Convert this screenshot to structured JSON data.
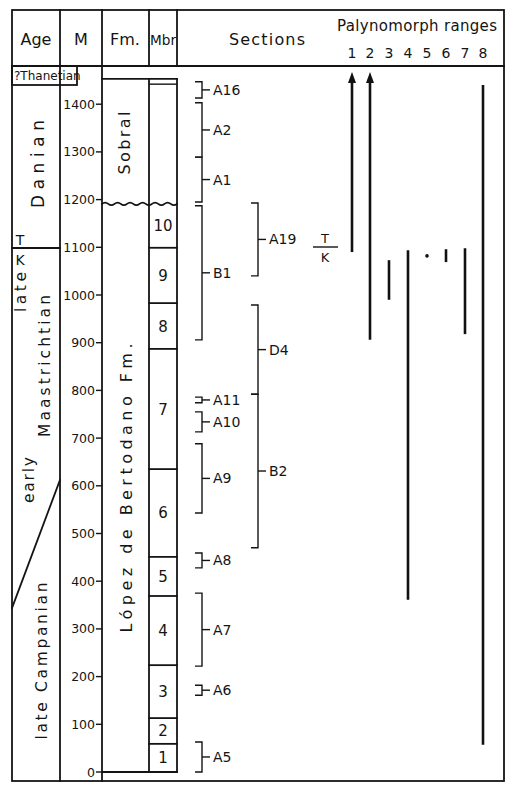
{
  "header": {
    "age": "Age",
    "m": "M",
    "fm": "Fm.",
    "mbr": "Mbr",
    "sections": "Sections",
    "palynomorph": "Palynomorph ranges",
    "range_numbers": [
      "1",
      "2",
      "3",
      "4",
      "5",
      "6",
      "7",
      "8"
    ]
  },
  "age_column": {
    "thanetian": "?Thanetian",
    "danian": "Danian",
    "t": "T",
    "k": "K",
    "late": "late",
    "maastrichtian": "Maastrichtian",
    "early": "early",
    "late_campanian": "late Campanian",
    "tk_boundary_m": 1098,
    "early_late_boundary_m": [
      612,
      344
    ]
  },
  "formations": {
    "sobral": "Sobral",
    "lopez": "López de Bertodano Fm.",
    "unconformity_m": 1191,
    "top_m": 1453,
    "sobral_inner_line_m": 1442
  },
  "meter_axis": {
    "label": "M",
    "ticks": [
      "0",
      "100",
      "200",
      "300",
      "400",
      "500",
      "600",
      "700",
      "800",
      "900",
      "1000",
      "1100",
      "1200",
      "1300",
      "1400"
    ]
  },
  "members": [
    {
      "label": "1",
      "base": 0,
      "top": 59
    },
    {
      "label": "2",
      "base": 59,
      "top": 113
    },
    {
      "label": "3",
      "base": 113,
      "top": 224
    },
    {
      "label": "4",
      "base": 224,
      "top": 369
    },
    {
      "label": "5",
      "base": 369,
      "top": 451
    },
    {
      "label": "6",
      "base": 451,
      "top": 635
    },
    {
      "label": "7",
      "base": 635,
      "top": 887
    },
    {
      "label": "8",
      "base": 887,
      "top": 983
    },
    {
      "label": "9",
      "base": 983,
      "top": 1099
    },
    {
      "label": "10",
      "base": 1099,
      "top": 1191
    }
  ],
  "sections": [
    {
      "label": "A16",
      "base": 1413,
      "top": 1447,
      "col": 1
    },
    {
      "label": "A2",
      "base": 1289,
      "top": 1403,
      "col": 1
    },
    {
      "label": "A1",
      "base": 1195,
      "top": 1289,
      "col": 1
    },
    {
      "label": "B1",
      "base": 906,
      "top": 1187,
      "col": 1
    },
    {
      "label": "A11",
      "base": 774,
      "top": 786,
      "col": 1
    },
    {
      "label": "A10",
      "base": 713,
      "top": 755,
      "col": 1
    },
    {
      "label": "A9",
      "base": 543,
      "top": 688,
      "col": 1
    },
    {
      "label": "A8",
      "base": 428,
      "top": 459,
      "col": 1
    },
    {
      "label": "A7",
      "base": 222,
      "top": 375,
      "col": 1
    },
    {
      "label": "A6",
      "base": 161,
      "top": 182,
      "col": 1
    },
    {
      "label": "A5",
      "base": 0,
      "top": 63,
      "col": 1
    },
    {
      "label": "A19",
      "base": 1040,
      "top": 1193,
      "col": 2
    },
    {
      "label": "D4",
      "base": 792,
      "top": 979,
      "col": 2
    },
    {
      "label": "B2",
      "base": 470,
      "top": 792,
      "col": 2
    }
  ],
  "tk_marker": {
    "t": "T",
    "k": "K",
    "level_m": 1098
  },
  "chart_data": {
    "type": "bar",
    "title": "Palynomorph ranges",
    "xlabel": "Palynomorph taxon",
    "ylabel": "M",
    "ylim": [
      0,
      1450
    ],
    "yticks": [
      0,
      100,
      200,
      300,
      400,
      500,
      600,
      700,
      800,
      900,
      1000,
      1100,
      1200,
      1300,
      1400
    ],
    "grid": false,
    "categories": [
      "1",
      "2",
      "3",
      "4",
      "5",
      "6",
      "7",
      "8"
    ],
    "ranges": [
      {
        "taxon": "1",
        "base_m": 1090,
        "top_m": 1467,
        "extends_above": true
      },
      {
        "taxon": "2",
        "base_m": 906,
        "top_m": 1467,
        "extends_above": true
      },
      {
        "taxon": "3",
        "base_m": 990,
        "top_m": 1073,
        "extends_above": false
      },
      {
        "taxon": "4",
        "base_m": 361,
        "top_m": 1094,
        "extends_above": false
      },
      {
        "taxon": "5",
        "base_m": 1082,
        "top_m": 1082,
        "extends_above": false,
        "single_occurrence": true
      },
      {
        "taxon": "6",
        "base_m": 1069,
        "top_m": 1096,
        "extends_above": false
      },
      {
        "taxon": "7",
        "base_m": 918,
        "top_m": 1098,
        "extends_above": false
      },
      {
        "taxon": "8",
        "base_m": 57,
        "top_m": 1440,
        "extends_above": false
      }
    ],
    "annotations": [
      "T/K boundary at ~1100 m",
      "Unconformity at ~1190 m between López de Bertodano Fm. and Sobral"
    ]
  }
}
